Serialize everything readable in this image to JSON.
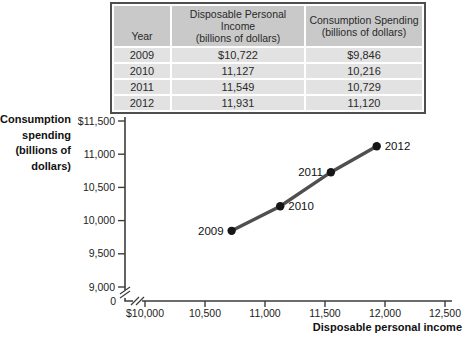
{
  "colors": {
    "axis": "#3d3d3d",
    "line": "#4f4f4f",
    "point": "#161616",
    "table_border": "#4e4e4e",
    "table_header_bg": "#c9c9c9",
    "table_row_bg": "#e2e2e2"
  },
  "table": {
    "columns": [
      {
        "label": "Year",
        "sublabel": ""
      },
      {
        "label": "Disposable Personal Income",
        "sublabel": "(billions of dollars)"
      },
      {
        "label": "Consumption Spending",
        "sublabel": "(billions of dollars)"
      }
    ],
    "rows": [
      {
        "year": "2009",
        "income": "$10,722",
        "spending": "$9,846"
      },
      {
        "year": "2010",
        "income": "11,127",
        "spending": "10,216"
      },
      {
        "year": "2011",
        "income": "11,549",
        "spending": "10,729"
      },
      {
        "year": "2012",
        "income": "11,931",
        "spending": "11,120"
      }
    ]
  },
  "chart_data": {
    "type": "line",
    "title": "",
    "xlabel": "Disposable personal income",
    "ylabel": "Consumption spending (billions of dollars)",
    "ylabel_lines": [
      "Consumption",
      "spending",
      "(billions of",
      "dollars)"
    ],
    "xlim": [
      10000,
      12500
    ],
    "ylim": [
      9000,
      11500
    ],
    "grid": false,
    "legend": null,
    "axis_break_x": true,
    "axis_break_y": true,
    "origin_label": "0",
    "x_ticks": [
      {
        "value": 10000,
        "label": "$10,000"
      },
      {
        "value": 10500,
        "label": "10,500"
      },
      {
        "value": 11000,
        "label": "11,000"
      },
      {
        "value": 11500,
        "label": "11,500"
      },
      {
        "value": 12000,
        "label": "12,000"
      },
      {
        "value": 12500,
        "label": "12,500"
      }
    ],
    "y_ticks": [
      {
        "value": 11500,
        "label": "$11,500"
      },
      {
        "value": 11000,
        "label": "11,000"
      },
      {
        "value": 10500,
        "label": "10,500"
      },
      {
        "value": 10000,
        "label": "10,000"
      },
      {
        "value": 9500,
        "label": "9,500"
      },
      {
        "value": 9000,
        "label": "9,000"
      }
    ],
    "series": [
      {
        "name": "consumption-function",
        "points": [
          {
            "x": 10722,
            "y": 9846,
            "label": "2009",
            "label_side": "left"
          },
          {
            "x": 11127,
            "y": 10216,
            "label": "2010",
            "label_side": "right"
          },
          {
            "x": 11549,
            "y": 10729,
            "label": "2011",
            "label_side": "left"
          },
          {
            "x": 11931,
            "y": 11120,
            "label": "2012",
            "label_side": "right"
          }
        ]
      }
    ]
  }
}
